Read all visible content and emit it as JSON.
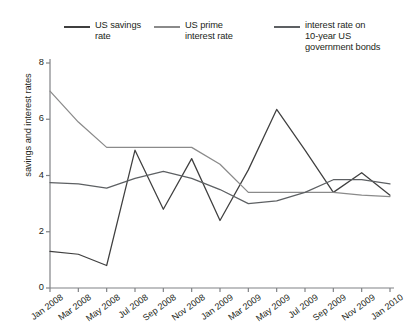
{
  "legend": {
    "entries": [
      {
        "label": "US savings\nrate",
        "color": "#3f3f3f",
        "name": "us-savings-rate"
      },
      {
        "label": "US prime\ninterest rate",
        "color": "#8a8a8a",
        "name": "us-prime-interest-rate"
      },
      {
        "label": "interest rate on\n10-year US\ngovernment bonds",
        "color": "#5d6063",
        "name": "interest-rate-10yr-bonds"
      }
    ]
  },
  "axes": {
    "y_title": "savings and interest rates",
    "y_ticks": [
      "0",
      "2",
      "4",
      "6",
      "8"
    ],
    "x_ticks": [
      "Jan 2008",
      "Mar 2008",
      "May 2008",
      "Jul 2008",
      "Sep 2008",
      "Nov 2008",
      "Jan 2009",
      "Mar 2009",
      "May 2009",
      "Jul 2009",
      "Sep 2009",
      "Nov 2009",
      "Jan 2010"
    ]
  },
  "chart_data": {
    "type": "line",
    "title": "",
    "xlabel": "",
    "ylabel": "savings and interest rates",
    "ylim": [
      0,
      8
    ],
    "grid": false,
    "legend_position": "top",
    "x": [
      "Jan 2008",
      "Mar 2008",
      "May 2008",
      "Jul 2008",
      "Sep 2008",
      "Nov 2008",
      "Jan 2009",
      "Mar 2009",
      "May 2009",
      "Jul 2009",
      "Sep 2009",
      "Nov 2009",
      "Jan 2010"
    ],
    "series": [
      {
        "name": "US savings rate",
        "color": "#3f3f3f",
        "values": [
          1.3,
          1.2,
          0.8,
          4.9,
          2.8,
          4.6,
          2.4,
          4.2,
          6.35,
          4.9,
          3.4,
          4.1,
          3.3
        ]
      },
      {
        "name": "US prime interest rate",
        "color": "#8a8a8a",
        "values": [
          7.0,
          5.9,
          5.0,
          5.0,
          5.0,
          5.0,
          4.4,
          3.4,
          3.4,
          3.4,
          3.4,
          3.3,
          3.25
        ]
      },
      {
        "name": "interest rate on 10-year US government bonds",
        "color": "#5d6063",
        "values": [
          3.75,
          3.7,
          3.55,
          3.9,
          4.15,
          3.9,
          3.5,
          3.0,
          3.1,
          3.4,
          3.85,
          3.85,
          3.7
        ]
      }
    ]
  }
}
